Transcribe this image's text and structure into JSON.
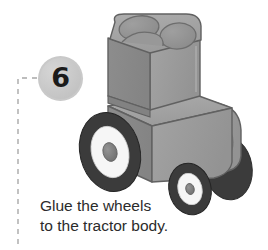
{
  "step": {
    "number": "6",
    "badge_color": "#c9c9c9",
    "number_color": "#1b1b1b"
  },
  "guide": {
    "line_color": "#a8a8a8",
    "style": "dashed"
  },
  "caption": {
    "line1": "Glue the wheels",
    "line2": "to the tractor body.",
    "text_color": "#2b2b2b"
  },
  "illustration": {
    "subject": "toy-tractor",
    "colors": {
      "body_front": "#8a8a8a",
      "body_side": "#9d9d9d",
      "body_top": "#a6a6a6",
      "body_dark": "#7a7a7a",
      "outline": "#5d5d5d",
      "tire": "#3b3b3b",
      "rim": "#f4f4f4",
      "hub": "#808080",
      "shadow": "#b5b5b5"
    },
    "parts": [
      {
        "name": "cab",
        "label": "tractor cab with two seat wells"
      },
      {
        "name": "hood",
        "label": "engine hood / lower body"
      },
      {
        "name": "rear-wheel-left",
        "label": "large left rear wheel"
      },
      {
        "name": "rear-wheel-right",
        "label": "large right rear wheel (partly hidden)"
      },
      {
        "name": "front-wheel",
        "label": "small front wheel"
      },
      {
        "name": "fender",
        "label": "rear fender arch"
      }
    ]
  }
}
